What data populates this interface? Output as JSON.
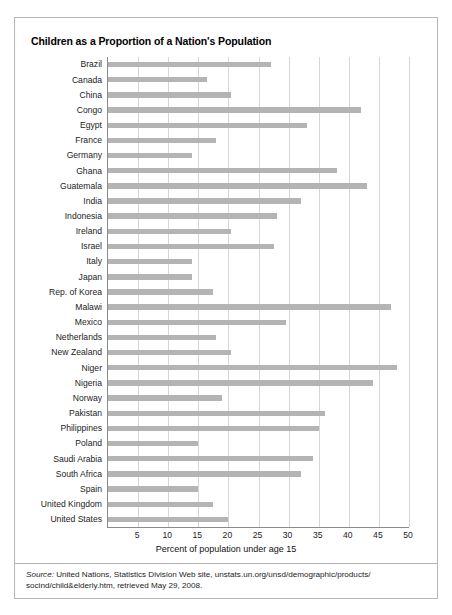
{
  "chart_data": {
    "type": "bar",
    "orientation": "horizontal",
    "title": "Children as a Proportion of a Nation's Population",
    "xlabel": "Percent of population under age 15",
    "ylabel": "",
    "xlim": [
      0,
      50
    ],
    "xticks": [
      5,
      10,
      15,
      20,
      25,
      30,
      35,
      40,
      45,
      50
    ],
    "grid": true,
    "legend": false,
    "bar_color": "#b4b4b4",
    "categories": [
      "Brazil",
      "Canada",
      "China",
      "Congo",
      "Egypt",
      "France",
      "Germany",
      "Ghana",
      "Guatemala",
      "India",
      "Indonesia",
      "Ireland",
      "Israel",
      "Italy",
      "Japan",
      "Rep. of Korea",
      "Malawi",
      "Mexico",
      "Netherlands",
      "New Zealand",
      "Niger",
      "Nigeria",
      "Norway",
      "Pakistan",
      "Philippines",
      "Poland",
      "Saudi Arabia",
      "South Africa",
      "Spain",
      "United Kingdom",
      "United States"
    ],
    "values": [
      27,
      16.5,
      20.5,
      42,
      33,
      18,
      14,
      38,
      43,
      32,
      28,
      20.5,
      27.5,
      14,
      14,
      17.5,
      47,
      29.5,
      18,
      20.5,
      48,
      44,
      19,
      36,
      35,
      15,
      34,
      32,
      15,
      17.5,
      20
    ]
  },
  "source": {
    "prefix": "Source:",
    "text": " United Nations, Statistics Division Web site, unstats.un.org/unsd/demographic/products/ socind/child&elderly.htm, retrieved May 29, 2008."
  }
}
